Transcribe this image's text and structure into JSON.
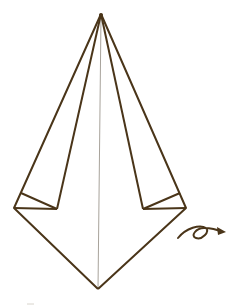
{
  "diagram": {
    "type": "origami-fold-step",
    "description": "Kite-shaped folded paper with two side flaps folded inward and a center crease; turn-over arrow indicates flipping the model",
    "colors": {
      "background": "#ffffff",
      "line": "#4a3519",
      "crease": "#a8a39b"
    },
    "shape": {
      "apex": [
        101,
        14
      ],
      "bottom_point": [
        98,
        289
      ],
      "left_corner": [
        14,
        208
      ],
      "right_corner": [
        186,
        208
      ],
      "left_inner_corner": [
        57,
        209
      ],
      "right_inner_corner": [
        143,
        209
      ],
      "left_flap_tip": [
        21,
        193
      ],
      "right_flap_tip": [
        180,
        193
      ]
    },
    "symbols": [
      {
        "name": "turn-over-arrow",
        "position": [
          178,
          238
        ],
        "direction": "right"
      }
    ]
  }
}
